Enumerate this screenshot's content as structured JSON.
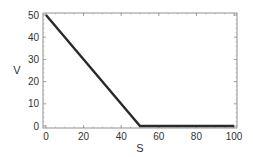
{
  "chart_data": {
    "type": "line",
    "title": "",
    "xlabel": "S",
    "ylabel": "V",
    "xlim": [
      0,
      100
    ],
    "ylim": [
      0,
      50
    ],
    "grid": false,
    "legend": null,
    "x_ticks": [
      0,
      20,
      40,
      60,
      80,
      100
    ],
    "y_ticks": [
      0,
      10,
      20,
      30,
      40,
      50
    ],
    "series": [
      {
        "name": "V",
        "color": "#2a2a2a",
        "x": [
          0,
          50,
          100
        ],
        "y": [
          50,
          0,
          0
        ]
      }
    ]
  }
}
